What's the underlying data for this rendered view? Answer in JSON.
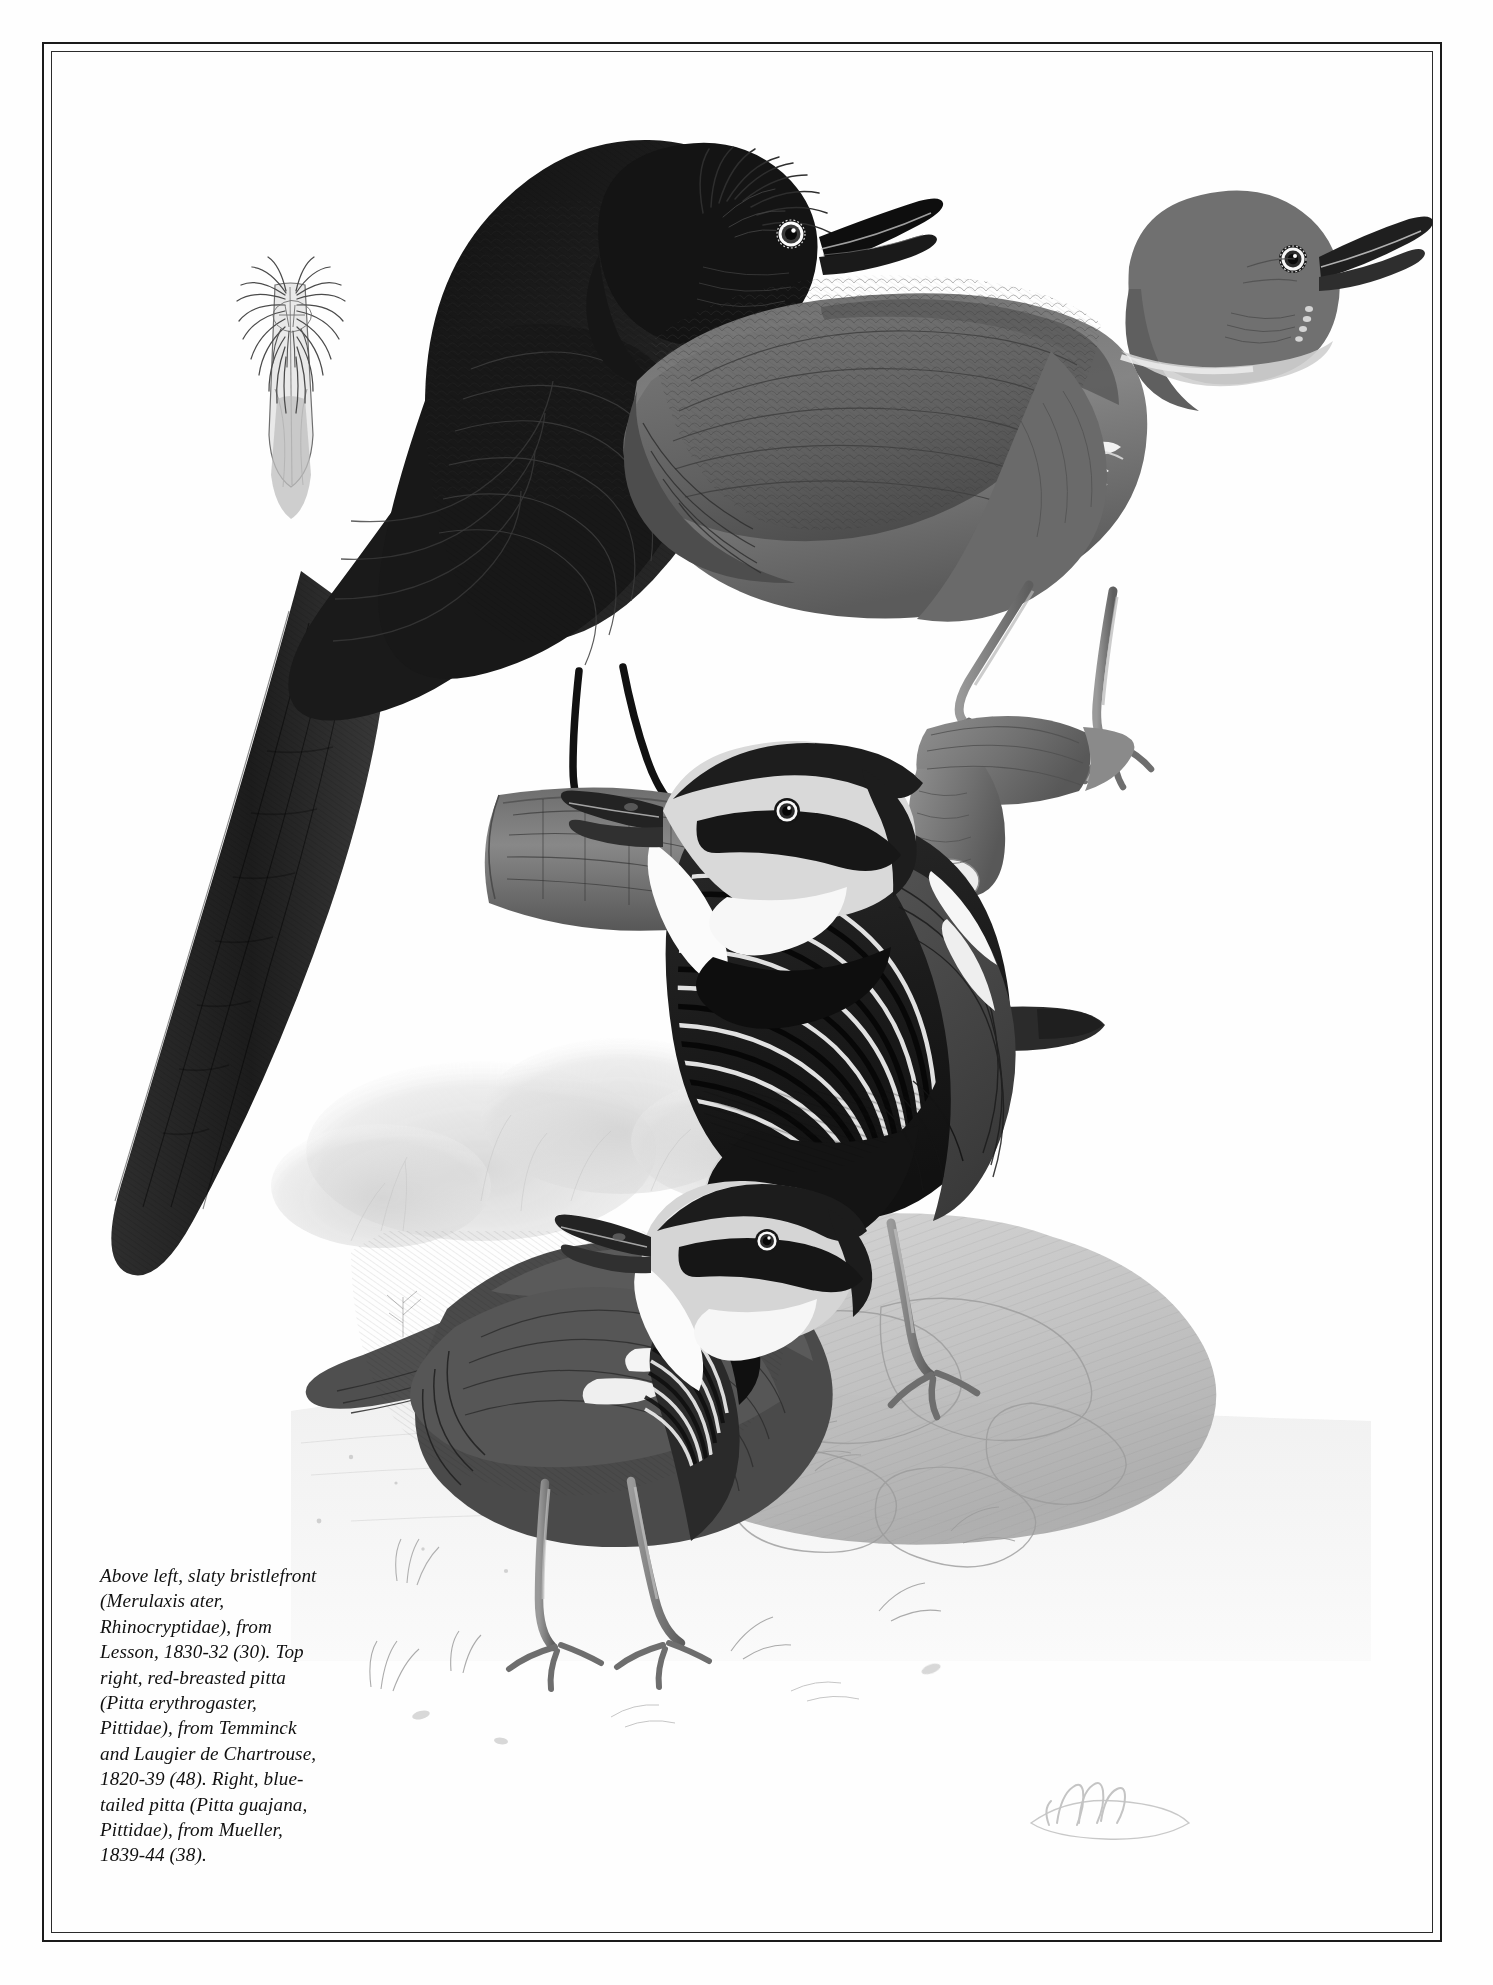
{
  "page": {
    "background_color": "#fefefe",
    "border_color": "#1a1a1a",
    "ink_color": "#101010"
  },
  "plate": {
    "title": "Bristlefront and pittas plate",
    "figures": [
      {
        "id": "bill-detail",
        "label": "bill-detail-study",
        "common_name": "slaty bristlefront bill detail",
        "description": "Dorsal view of bill showing nasal bristles",
        "position": "upper left"
      },
      {
        "id": "slaty-bristlefront",
        "label": "slaty-bristlefront",
        "common_name": "slaty bristlefront",
        "scientific_name": "Merulaxis ater",
        "family": "Rhinocryptidae",
        "source": "Lesson, 1830-32 (30)",
        "position": "above left",
        "perch": "log"
      },
      {
        "id": "red-breasted-pitta",
        "label": "red-breasted-pitta",
        "common_name": "red-breasted pitta",
        "scientific_name": "Pitta erythrogaster",
        "family": "Pittidae",
        "source": "Temminck and Laugier de Chartrouse, 1820-39 (48)",
        "position": "top right",
        "perch": "branch stump"
      },
      {
        "id": "blue-tailed-pitta-right",
        "label": "blue-tailed-pitta-standing",
        "common_name": "blue-tailed pitta",
        "scientific_name": "Pitta guajana",
        "family": "Pittidae",
        "source": "Mueller, 1839-44 (38)",
        "position": "right",
        "perch": "rock"
      },
      {
        "id": "blue-tailed-pitta-left",
        "label": "blue-tailed-pitta-ground",
        "common_name": "blue-tailed pitta",
        "scientific_name": "Pitta guajana",
        "family": "Pittidae",
        "source": "Mueller, 1839-44 (38)",
        "position": "lower centre",
        "perch": "ground"
      }
    ],
    "signature": "artist monogram"
  },
  "caption": {
    "text": "Above left, slaty bristlefront\n(Merulaxis ater,\nRhinocryptidae), from\nLesson, 1830-32 (30). Top\nright, red-breasted pitta\n(Pitta erythrogaster,\nPittidae), from Temminck\nand Laugier de Chartrouse,\n1820-39 (48). Right, blue-\ntailed pitta (Pitta guajana,\nPittidae), from Mueller,\n1839-44 (38).",
    "lines": [
      "Above left, slaty bristlefront",
      "(Merulaxis ater,",
      "Rhinocryptidae), from",
      "Lesson, 1830-32 (30). Top",
      "right, red-breasted pitta",
      "(Pitta erythrogaster,",
      "Pittidae), from Temminck",
      "and Laugier de Chartrouse,",
      "1820-39 (48). Right, blue-",
      "tailed pitta (Pitta guajana,",
      "Pittidae), from Mueller,",
      "1839-44 (38)."
    ]
  }
}
